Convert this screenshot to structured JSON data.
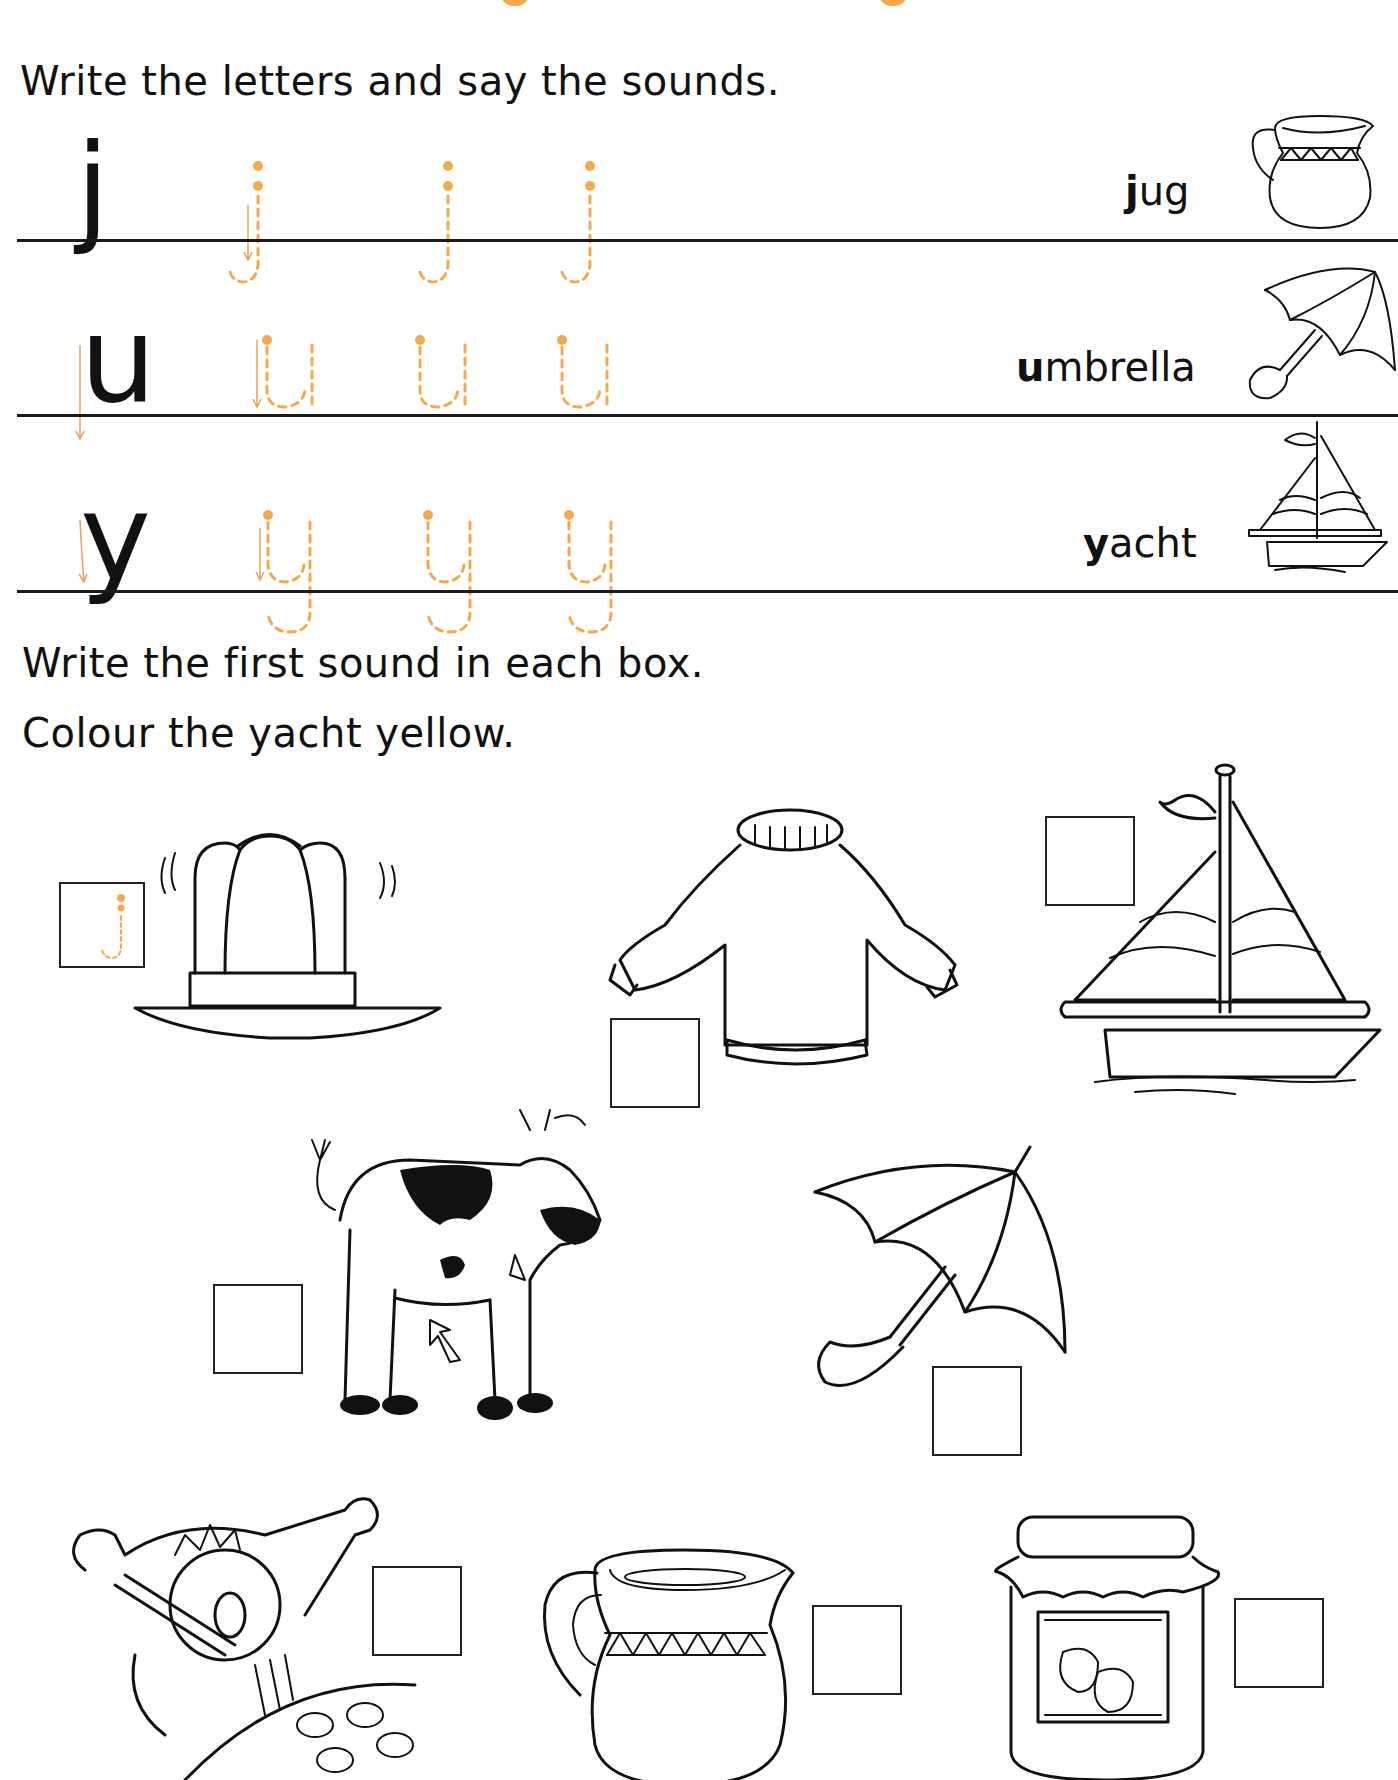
{
  "worksheet": {
    "title_fragment_color": "#f5a94a",
    "instruction_1": "Write the letters and say the sounds.",
    "letter_rows": [
      {
        "letter": "j",
        "trace_count": 3,
        "word_initial": "j",
        "word_rest": "ug",
        "picture": "jug"
      },
      {
        "letter": "u",
        "trace_count": 3,
        "word_initial": "u",
        "word_rest": "mbrella",
        "picture": "umbrella"
      },
      {
        "letter": "y",
        "trace_count": 3,
        "word_initial": "y",
        "word_rest": "acht",
        "picture": "yacht"
      }
    ],
    "instruction_2": "Write the first sound in each box.",
    "instruction_3": "Colour the yacht yellow.",
    "picture_items": [
      {
        "picture": "jelly",
        "answer": "j",
        "hint_traced": "j"
      },
      {
        "picture": "jumper",
        "answer": ""
      },
      {
        "picture": "yacht",
        "answer": ""
      },
      {
        "picture": "cow",
        "answer": ""
      },
      {
        "picture": "umbrella",
        "answer": ""
      },
      {
        "picture": "yawning boy",
        "answer": ""
      },
      {
        "picture": "jug",
        "answer": ""
      },
      {
        "picture": "jam",
        "answer": ""
      }
    ],
    "colors": {
      "ink": "#111111",
      "trace_orange": "#f5a94a",
      "rule_line": "#1a1a1a"
    }
  }
}
